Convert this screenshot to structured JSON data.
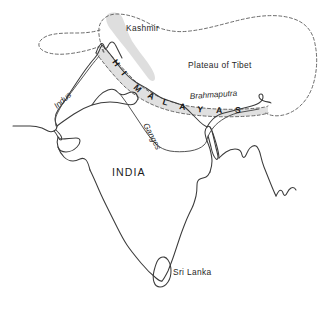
{
  "map": {
    "title": "Indian Subcontinent physical map",
    "background_color": "#ffffff",
    "coast_color": "#3b3b3b",
    "river_color": "#4a4a4a",
    "boundary_color": "#5a5a5a",
    "shade_color": "#dcdcdc",
    "labels": {
      "kashmir": "Kashmir",
      "plateau_of_tibet": "Plateau of Tibet",
      "brahmaputra": "Brahmaputra",
      "indus": "Indus",
      "ganges": "Ganges",
      "india": "INDIA",
      "sri_lanka": "Sri Lanka"
    },
    "mountain_range": {
      "name": "HIMALAYAS",
      "letters": [
        "H",
        "I",
        "M",
        "A",
        "L",
        "A",
        "Y",
        "A",
        "S"
      ]
    },
    "regions": [
      {
        "name": "Kashmir",
        "type": "shaded-region"
      },
      {
        "name": "Plateau of Tibet",
        "type": "dashed-boundary-region"
      },
      {
        "name": "Himalayas",
        "type": "shaded-mountain-belt"
      },
      {
        "name": "INDIA",
        "type": "country"
      },
      {
        "name": "Sri Lanka",
        "type": "island"
      }
    ],
    "rivers": [
      "Indus",
      "Ganges",
      "Brahmaputra"
    ]
  }
}
